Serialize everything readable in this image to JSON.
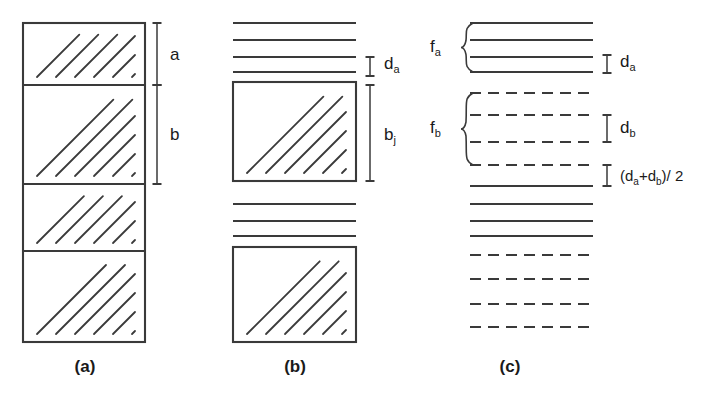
{
  "figure": {
    "background_color": "#ffffff",
    "ink_color": "#3a3a3a",
    "text_color": "#1a1a1a"
  },
  "panels": [
    {
      "id": "a",
      "caption": "(a)",
      "caption_x": 85,
      "caption_y": 372,
      "box": {
        "x": 23,
        "y": 23,
        "width": 122,
        "height": 319
      },
      "divider_y": [
        85,
        184,
        251
      ],
      "bands": [
        {
          "name": "band-a-1",
          "y0": 23,
          "y1": 85,
          "hatch_count": 6,
          "hatch_spacing": 19
        },
        {
          "name": "band-b-1",
          "y0": 85,
          "y1": 184,
          "hatch_count": 8,
          "hatch_spacing": 19
        },
        {
          "name": "band-a-2",
          "y0": 184,
          "y1": 251,
          "hatch_count": 6,
          "hatch_spacing": 19
        },
        {
          "name": "band-b-2",
          "y0": 251,
          "y1": 342,
          "hatch_count": 8,
          "hatch_spacing": 19
        }
      ],
      "dimensions": [
        {
          "name": "a",
          "label": "a",
          "sub": "",
          "line_x": 157,
          "y0": 23,
          "y1": 85,
          "label_x": 170,
          "label_y": 60
        },
        {
          "name": "b",
          "label": "b",
          "sub": "",
          "line_x": 157,
          "y0": 85,
          "y1": 184,
          "label_x": 170,
          "label_y": 140
        }
      ]
    },
    {
      "id": "b",
      "caption": "(b)",
      "caption_x": 295,
      "caption_y": 372,
      "line_x0": 233,
      "line_x1": 356,
      "solid_lines_y": [
        23,
        40,
        57,
        72,
        204,
        221,
        236
      ],
      "boxes": [
        {
          "name": "crystal-box-1",
          "x": 233,
          "y": 82,
          "width": 123,
          "height": 99,
          "hatch_count": 8,
          "hatch_spacing": 19
        },
        {
          "name": "crystal-box-2",
          "x": 233,
          "y": 247,
          "width": 123,
          "height": 95,
          "hatch_count": 8,
          "hatch_spacing": 19
        }
      ],
      "dimensions": [
        {
          "name": "d_a",
          "label": "d",
          "sub": "a",
          "line_x": 370,
          "y0": 57,
          "y1": 76,
          "label_x": 384,
          "label_y": 69
        },
        {
          "name": "b_j",
          "label": "b",
          "sub": "j",
          "line_x": 370,
          "y0": 85,
          "y1": 181,
          "label_x": 384,
          "label_y": 140
        }
      ]
    },
    {
      "id": "c",
      "caption": "(c)",
      "caption_x": 510,
      "caption_y": 372,
      "line_x0": 470,
      "line_x1": 593,
      "lines": [
        {
          "y": 23,
          "style": "solid"
        },
        {
          "y": 40,
          "style": "solid"
        },
        {
          "y": 57,
          "style": "solid"
        },
        {
          "y": 72,
          "style": "solid"
        },
        {
          "y": 93,
          "style": "dashed"
        },
        {
          "y": 115,
          "style": "dashed"
        },
        {
          "y": 142,
          "style": "dashed"
        },
        {
          "y": 165,
          "style": "dashed"
        },
        {
          "y": 186,
          "style": "solid"
        },
        {
          "y": 204,
          "style": "solid"
        },
        {
          "y": 221,
          "style": "solid"
        },
        {
          "y": 236,
          "style": "solid"
        },
        {
          "y": 255,
          "style": "dashed"
        },
        {
          "y": 279,
          "style": "dashed"
        },
        {
          "y": 304,
          "style": "dashed"
        },
        {
          "y": 327,
          "style": "dashed"
        }
      ],
      "braces": [
        {
          "name": "f_a",
          "label": "f",
          "sub": "a",
          "x": 462,
          "y0": 23,
          "y1": 72,
          "label_x": 430,
          "label_y": 52
        },
        {
          "name": "f_b",
          "label": "f",
          "sub": "b",
          "x": 462,
          "y0": 93,
          "y1": 165,
          "label_x": 430,
          "label_y": 133
        }
      ],
      "dimensions": [
        {
          "name": "d_a",
          "label": "d",
          "sub": "a",
          "line_x": 607,
          "y0": 55,
          "y1": 73,
          "label_x": 620,
          "label_y": 67
        },
        {
          "name": "d_b",
          "label": "d",
          "sub": "b",
          "line_x": 607,
          "y0": 115,
          "y1": 142,
          "label_x": 620,
          "label_y": 133
        }
      ],
      "formula": {
        "name": "d_avg",
        "parts": [
          "(d",
          "a",
          "+d",
          "b",
          ")/ 2"
        ],
        "line_x": 607,
        "y0": 165,
        "y1": 186,
        "label_x": 620,
        "label_y": 181
      }
    }
  ]
}
